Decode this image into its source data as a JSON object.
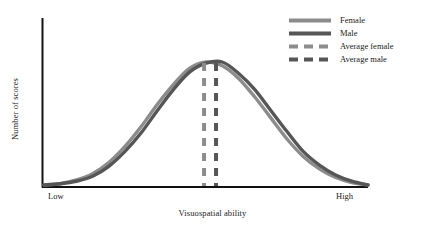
{
  "chart_data": {
    "type": "line",
    "title": "",
    "xlabel": "Visuospatial ability",
    "ylabel": "Number of scores",
    "xtick_labels": [
      "Low",
      "High"
    ],
    "ytick_labels": [],
    "grid": false,
    "legend_position": "top-right",
    "annotations": [
      {
        "name": "average-female-line",
        "type": "vertical-dashed",
        "x_fraction": 0.494,
        "label": "Average female"
      },
      {
        "name": "average-male-line",
        "type": "vertical-dashed",
        "x_fraction": 0.531,
        "label": "Average male"
      }
    ],
    "series": [
      {
        "name": "Female",
        "style": "solid",
        "color": "#8c8c8c",
        "distribution": "normal",
        "mean_x_fraction": 0.494,
        "peak_value": 1.0,
        "x": [
          0.0,
          0.05,
          0.1,
          0.15,
          0.2,
          0.25,
          0.3,
          0.35,
          0.4,
          0.45,
          0.5,
          0.55,
          0.6,
          0.65,
          0.7,
          0.75,
          0.8,
          0.85,
          0.9,
          0.95,
          1.0
        ],
        "values": [
          0.01,
          0.02,
          0.05,
          0.1,
          0.19,
          0.32,
          0.48,
          0.66,
          0.82,
          0.95,
          1.0,
          0.97,
          0.87,
          0.72,
          0.55,
          0.38,
          0.24,
          0.14,
          0.07,
          0.03,
          0.01
        ]
      },
      {
        "name": "Male",
        "style": "solid",
        "color": "#565656",
        "distribution": "normal",
        "mean_x_fraction": 0.531,
        "peak_value": 1.0,
        "x": [
          0.0,
          0.05,
          0.1,
          0.15,
          0.2,
          0.25,
          0.3,
          0.35,
          0.4,
          0.45,
          0.5,
          0.55,
          0.6,
          0.65,
          0.7,
          0.75,
          0.8,
          0.85,
          0.9,
          0.95,
          1.0
        ],
        "values": [
          0.01,
          0.02,
          0.04,
          0.08,
          0.16,
          0.28,
          0.43,
          0.61,
          0.78,
          0.92,
          0.99,
          1.0,
          0.91,
          0.78,
          0.61,
          0.44,
          0.28,
          0.17,
          0.09,
          0.04,
          0.01
        ]
      }
    ]
  },
  "axes": {
    "x_title": "Visuospatial ability",
    "y_title": "Number of scores",
    "x_low_label": "Low",
    "x_high_label": "High",
    "axis_color": "#111111"
  },
  "legend": {
    "items": [
      {
        "label": "Female",
        "color": "#8c8c8c",
        "style": "solid"
      },
      {
        "label": "Male",
        "color": "#565656",
        "style": "solid"
      },
      {
        "label": "Average female",
        "color": "#8c8c8c",
        "style": "dashed"
      },
      {
        "label": "Average male",
        "color": "#565656",
        "style": "dashed"
      }
    ]
  },
  "colors": {
    "female": "#8c8c8c",
    "male": "#565656",
    "axis": "#111111",
    "background": "#ffffff",
    "text": "#1a1a1a"
  }
}
